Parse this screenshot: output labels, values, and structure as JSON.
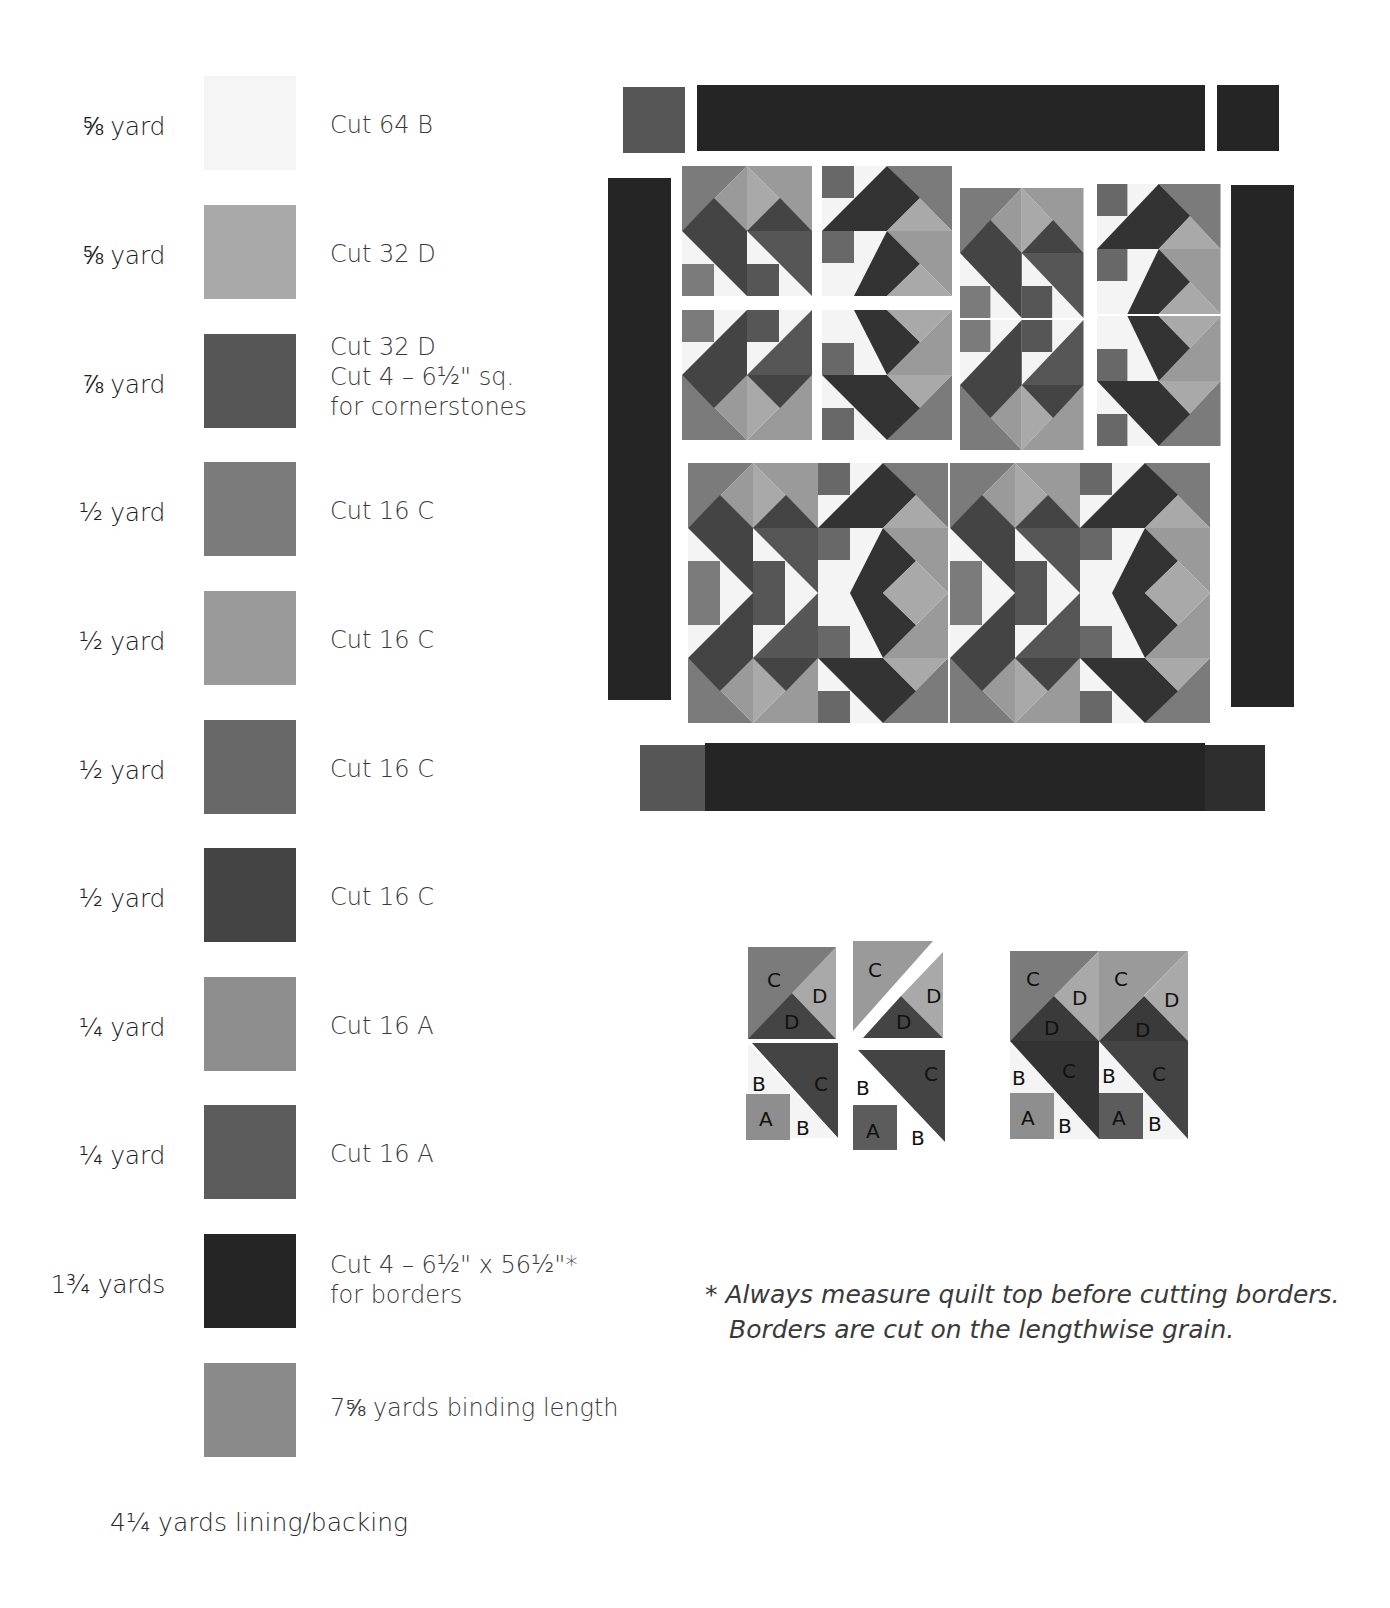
{
  "materials": [
    {
      "amount": "⅝ yard",
      "swatch": "#f4f4f4",
      "cut": "Cut 64 B"
    },
    {
      "amount": "⅝ yard",
      "swatch": "#a9a9a9",
      "cut": "Cut 32 D"
    },
    {
      "amount": "⅞ yard",
      "swatch": "#565656",
      "cut": "Cut 32 D\nCut 4 – 6½\" sq.\nfor cornerstones"
    },
    {
      "amount": "½ yard",
      "swatch": "#7b7b7b",
      "cut": "Cut 16 C"
    },
    {
      "amount": "½ yard",
      "swatch": "#9a9a9a",
      "cut": "Cut 16 C"
    },
    {
      "amount": "½ yard",
      "swatch": "#686868",
      "cut": "Cut 16 C"
    },
    {
      "amount": "½ yard",
      "swatch": "#444444",
      "cut": "Cut 16 C"
    },
    {
      "amount": "¼ yard",
      "swatch": "#8e8e8e",
      "cut": "Cut 16 A"
    },
    {
      "amount": "¼ yard",
      "swatch": "#5c5c5c",
      "cut": "Cut 16 A"
    },
    {
      "amount": "1¾ yards",
      "swatch": "#252525",
      "cut": "Cut 4 – 6½\" x 56½\"*\nfor borders"
    },
    {
      "amount": "",
      "swatch": "#8a8a8a",
      "cut": "7⅝ yards binding length"
    }
  ],
  "footer": "4¼ yards lining/backing",
  "note": {
    "line1": "* Always measure quilt top before cutting borders.",
    "line2": "Borders are cut on the lengthwise grain."
  },
  "diagram_labels": {
    "C": "C",
    "D": "D",
    "B": "B",
    "A": "A"
  },
  "colors": {
    "background": "#222222",
    "border": "#252525",
    "cornerstone": "#565656"
  }
}
